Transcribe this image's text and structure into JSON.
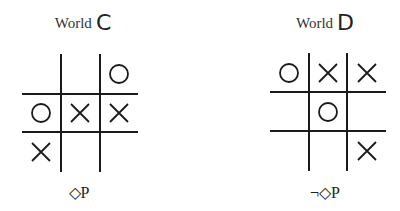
{
  "worlds": [
    {
      "title_prefix": "World",
      "title_letter": "C",
      "formula": "◇P",
      "board": [
        [
          "",
          "",
          "O"
        ],
        [
          "O",
          "X",
          "X"
        ],
        [
          "X",
          "",
          ""
        ]
      ]
    },
    {
      "title_prefix": "World",
      "title_letter": "D",
      "formula": "¬◇P",
      "board": [
        [
          "O",
          "X",
          "X"
        ],
        [
          "",
          "O",
          ""
        ],
        [
          "",
          "",
          "X"
        ]
      ]
    }
  ]
}
